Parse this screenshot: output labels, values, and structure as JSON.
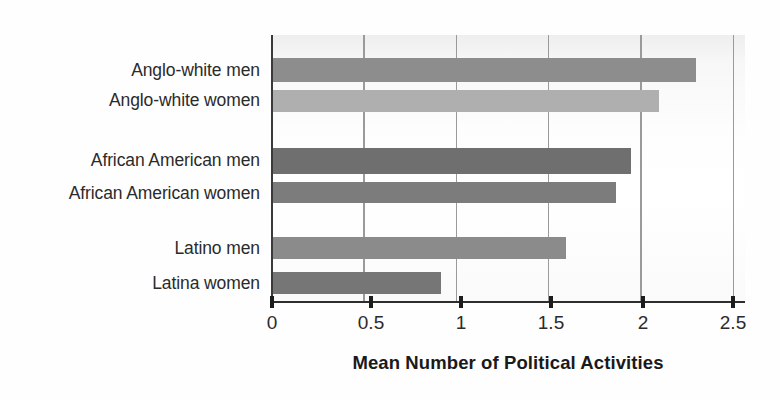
{
  "chart_data": {
    "type": "bar",
    "orientation": "horizontal",
    "title": "",
    "xlabel": "Mean Number of Political Activities",
    "ylabel": "",
    "xlim": [
      0,
      2.5
    ],
    "xticks": [
      "0",
      "0.5",
      "1",
      "1.5",
      "2",
      "2.5"
    ],
    "xtick_values": [
      0,
      0.5,
      1,
      1.5,
      2,
      2.5
    ],
    "grid": true,
    "legend": "none",
    "categories": [
      "Anglo-white men",
      "Anglo-white women",
      "African American men",
      "African American women",
      "Latino men",
      "Latina women"
    ],
    "values": [
      2.3,
      2.1,
      1.95,
      1.87,
      1.6,
      0.92
    ],
    "bars": [
      {
        "label": "Anglo-white men",
        "value": 2.3,
        "color": "#8d8d8d",
        "group": "anglo-white"
      },
      {
        "label": "Anglo-white women",
        "value": 2.1,
        "color": "#afafaf",
        "group": "anglo-white"
      },
      {
        "label": "African American men",
        "value": 1.95,
        "color": "#6f6f6f",
        "group": "african-american"
      },
      {
        "label": "African American women",
        "value": 1.87,
        "color": "#7c7c7c",
        "group": "african-american"
      },
      {
        "label": "Latino men",
        "value": 1.6,
        "color": "#8b8b8b",
        "group": "latino"
      },
      {
        "label": "Latina women",
        "value": 0.92,
        "color": "#767676",
        "group": "latino"
      }
    ],
    "colors": {
      "gridline": "#9a9a9a",
      "axis": "#2e2e2e",
      "text": "#2b2b2b",
      "plot_background": "#fdfdfd"
    }
  }
}
